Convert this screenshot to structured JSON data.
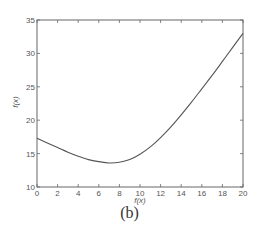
{
  "chart_data": {
    "type": "line",
    "title": "",
    "xlabel": "f(x)",
    "ylabel": "f(x)",
    "xlim": [
      0,
      20
    ],
    "ylim": [
      10,
      35
    ],
    "xticks": [
      0,
      2,
      4,
      6,
      8,
      10,
      12,
      14,
      16,
      18,
      20
    ],
    "yticks": [
      10,
      15,
      20,
      25,
      30,
      35
    ],
    "grid": false,
    "legend": null,
    "series": [
      {
        "name": "f(x)",
        "color": "#555555",
        "x": [
          0,
          1,
          2,
          3,
          4,
          5,
          6,
          7,
          8,
          9,
          10,
          11,
          12,
          13,
          14,
          15,
          16,
          17,
          18,
          19,
          20
        ],
        "y": [
          17.3,
          16.6,
          15.9,
          15.2,
          14.6,
          14.1,
          13.8,
          13.6,
          13.7,
          14.1,
          14.9,
          16.0,
          17.4,
          19.0,
          20.8,
          22.7,
          24.7,
          26.7,
          28.8,
          30.9,
          33.0
        ]
      }
    ]
  },
  "caption": "(b)"
}
